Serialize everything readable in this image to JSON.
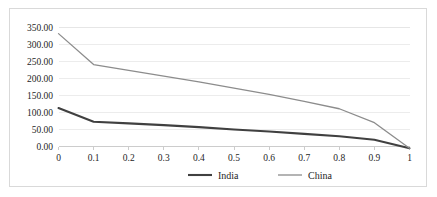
{
  "chart_data": {
    "type": "line",
    "title": "",
    "xlabel": "",
    "ylabel": "",
    "x": [
      0,
      0.1,
      0.2,
      0.3,
      0.4,
      0.5,
      0.6,
      0.7,
      0.8,
      0.9,
      1
    ],
    "xtick_labels": [
      "0",
      "0.1",
      "0.2",
      "0.3",
      "0.4",
      "0.5",
      "0.6",
      "0.7",
      "0.8",
      "0.9",
      "1"
    ],
    "ytick_labels": [
      "0.00",
      "50.00",
      "100.00",
      "150.00",
      "200.00",
      "250.00",
      "300.00",
      "350.00"
    ],
    "ytick_values": [
      0,
      50,
      100,
      150,
      200,
      250,
      300,
      350
    ],
    "ylim": [
      0,
      350
    ],
    "xlim": [
      0,
      1
    ],
    "grid": true,
    "grid_axis": "y",
    "legend_position": "bottom",
    "series": [
      {
        "name": "India",
        "color": "#404040",
        "line_width": 2.1,
        "values": [
          113,
          73,
          68,
          63,
          57,
          50,
          44,
          37,
          30,
          20,
          -5
        ]
      },
      {
        "name": "China",
        "color": "#8c8c8c",
        "line_width": 1.3,
        "values": [
          332,
          241,
          224,
          207,
          190,
          172,
          153,
          133,
          111,
          70,
          -5
        ]
      }
    ]
  },
  "legend": {
    "items": [
      {
        "label": "India"
      },
      {
        "label": "China"
      }
    ]
  }
}
